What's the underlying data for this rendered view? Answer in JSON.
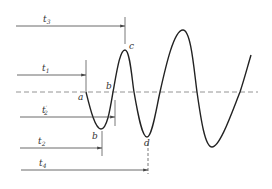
{
  "diagram": {
    "type": "waveform-timing",
    "colors": {
      "wave": "#222222",
      "reference": "#888888",
      "arrows": "#444444",
      "text": "#333333"
    },
    "points": {
      "a": {
        "label": "a",
        "x": 86,
        "y": 92
      },
      "b_upper": {
        "label": "b",
        "x": 113,
        "y": 92
      },
      "b_lower": {
        "label": "b",
        "x": 101,
        "y": 129
      },
      "c": {
        "label": "c",
        "x": 125,
        "y": 50
      },
      "d": {
        "label": "d",
        "x": 147,
        "y": 137
      }
    },
    "intervals": [
      {
        "id": "t3",
        "base": "t",
        "sub": "3",
        "prime": "",
        "y": 26,
        "x_start": 16,
        "x_end": 125
      },
      {
        "id": "t1",
        "base": "t",
        "sub": "1",
        "prime": "",
        "y": 75,
        "x_start": 17,
        "x_end": 86
      },
      {
        "id": "t2p",
        "base": "t",
        "sub": "2",
        "prime": "′",
        "y": 117,
        "x_start": 20,
        "x_end": 115
      },
      {
        "id": "t2",
        "base": "t",
        "sub": "2",
        "prime": "",
        "y": 148,
        "x_start": 20,
        "x_end": 102
      },
      {
        "id": "t4",
        "base": "t",
        "sub": "4",
        "prime": "",
        "y": 170,
        "x_start": 21,
        "x_end": 148
      }
    ]
  }
}
